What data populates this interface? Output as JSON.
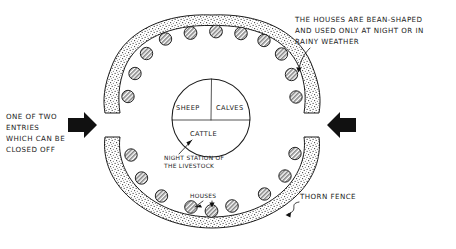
{
  "diagram": {
    "style": "hand-drawn ink sketch",
    "background_color": "#ffffff",
    "ink_color": "#1c1c1c"
  },
  "annotations": {
    "houses_note": {
      "line1": "THE  HOUSES ARE  BEAN-SHAPED",
      "line2": "AND USED ONLY AT NIGHT OR IN",
      "line3": "RAINY  WEATHER"
    },
    "entry_note": {
      "line1": "ONE OF TWO",
      "line2": "ENTRIES",
      "line3": "WHICH CAN BE",
      "line4": "CLOSED OFF"
    },
    "night_station_note": {
      "line1": "NIGHT  STATION OF",
      "line2": "THE  LIVESTOCK"
    },
    "houses_label": "HOUSES",
    "thorn_fence_label": "THORN  FENCE"
  },
  "inner_circle": {
    "sheep_label": "SHEEP",
    "calves_label": "CALVES",
    "cattle_label": "CATTLE"
  },
  "huts": {
    "count": 19,
    "shape": "circle-hatched",
    "positions": [
      {
        "cx": 165.5,
        "cy": 39.0,
        "r": 6.2
      },
      {
        "cx": 190.5,
        "cy": 33.0,
        "r": 6.4
      },
      {
        "cx": 216.0,
        "cy": 31.5,
        "r": 6.4
      },
      {
        "cx": 241.0,
        "cy": 33.5,
        "r": 6.3
      },
      {
        "cx": 264.0,
        "cy": 40.5,
        "r": 6.2
      },
      {
        "cx": 146.5,
        "cy": 53.5,
        "r": 6.2
      },
      {
        "cx": 281.5,
        "cy": 54.0,
        "r": 6.2
      },
      {
        "cx": 135.0,
        "cy": 73.5,
        "r": 6.2
      },
      {
        "cx": 291.5,
        "cy": 74.5,
        "r": 6.2
      },
      {
        "cx": 128.0,
        "cy": 96.5,
        "r": 6.2
      },
      {
        "cx": 296.0,
        "cy": 97.0,
        "r": 6.2
      },
      {
        "cx": 131.0,
        "cy": 155.0,
        "r": 6.2
      },
      {
        "cx": 295.0,
        "cy": 153.5,
        "r": 6.2
      },
      {
        "cx": 141.5,
        "cy": 178.0,
        "r": 6.2
      },
      {
        "cx": 285.0,
        "cy": 176.0,
        "r": 6.2
      },
      {
        "cx": 161.5,
        "cy": 196.0,
        "r": 6.2
      },
      {
        "cx": 264.5,
        "cy": 194.0,
        "r": 6.2
      },
      {
        "cx": 191.0,
        "cy": 207.0,
        "r": 6.3
      },
      {
        "cx": 232.0,
        "cy": 206.0,
        "r": 6.3
      },
      {
        "cx": 211.5,
        "cy": 211.0,
        "r": 6.4
      }
    ]
  },
  "entries": {
    "count": 2,
    "left_arrow": "solid-right-arrow",
    "right_arrow": "solid-left-arrow"
  }
}
